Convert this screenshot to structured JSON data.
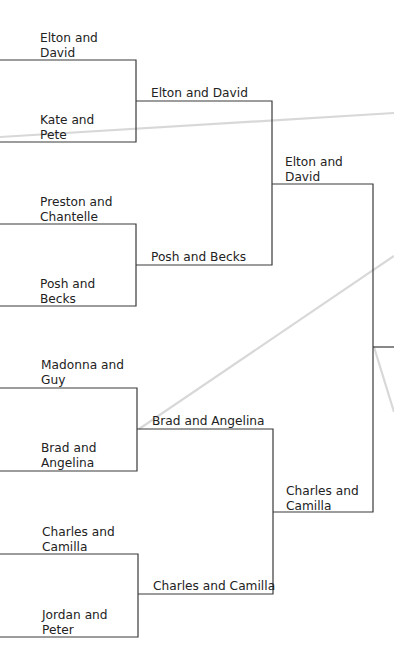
{
  "bracket": {
    "round1": [
      {
        "label": "Elton and David",
        "lines": [
          "Elton and",
          "David"
        ]
      },
      {
        "label": "Kate and Pete",
        "lines": [
          "Kate and",
          "Pete"
        ]
      },
      {
        "label": "Preston and Chantelle",
        "lines": [
          "Preston and",
          "Chantelle"
        ]
      },
      {
        "label": "Posh and Becks",
        "lines": [
          "Posh and",
          "Becks"
        ]
      },
      {
        "label": "Madonna and Guy",
        "lines": [
          "Madonna and",
          "Guy"
        ]
      },
      {
        "label": "Brad and Angelina",
        "lines": [
          "Brad and",
          "Angelina"
        ]
      },
      {
        "label": "Charles and Camilla",
        "lines": [
          "Charles and",
          "Camilla"
        ]
      },
      {
        "label": "Jordan and Peter",
        "lines": [
          "Jordan and",
          "Peter"
        ]
      }
    ],
    "round2": [
      {
        "label": "Elton and David"
      },
      {
        "label": "Posh and Becks"
      },
      {
        "label": "Brad and Angelina"
      },
      {
        "label": "Charles and Camilla"
      }
    ],
    "round3": [
      {
        "label": "Elton and David",
        "lines": [
          "Elton and",
          "David"
        ]
      },
      {
        "label": "Charles and Camilla",
        "lines": [
          "Charles and",
          "Camilla"
        ]
      }
    ]
  },
  "colors": {
    "line": "#3a3a3a",
    "text": "#222222",
    "guide": "#d6d6d6"
  }
}
